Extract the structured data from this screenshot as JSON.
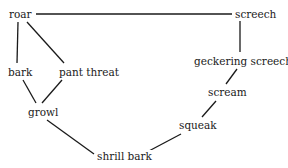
{
  "diagram": {
    "nodes": [
      {
        "id": "roar",
        "label": "roar",
        "x": 8,
        "y": 8
      },
      {
        "id": "screech",
        "label": "screech",
        "x": 234,
        "y": 8
      },
      {
        "id": "bark",
        "label": "bark",
        "x": 7,
        "y": 66
      },
      {
        "id": "pant_threat",
        "label": "pant threat",
        "x": 58,
        "y": 66
      },
      {
        "id": "geckering_screech",
        "label": "geckering screech",
        "x": 193,
        "y": 55
      },
      {
        "id": "growl",
        "label": "growl",
        "x": 27,
        "y": 106
      },
      {
        "id": "scream",
        "label": "scream",
        "x": 207,
        "y": 86
      },
      {
        "id": "squeak",
        "label": "squeak",
        "x": 178,
        "y": 119
      },
      {
        "id": "shrill_bark",
        "label": "shrill bark",
        "x": 96,
        "y": 150
      }
    ],
    "edges": [
      [
        "roar",
        "screech"
      ],
      [
        "roar",
        "bark"
      ],
      [
        "roar",
        "pant_threat"
      ],
      [
        "bark",
        "growl"
      ],
      [
        "pant_threat",
        "growl"
      ],
      [
        "growl",
        "shrill_bark"
      ],
      [
        "screech",
        "geckering_screech"
      ],
      [
        "geckering_screech",
        "scream"
      ],
      [
        "scream",
        "squeak"
      ],
      [
        "squeak",
        "shrill_bark"
      ]
    ]
  }
}
